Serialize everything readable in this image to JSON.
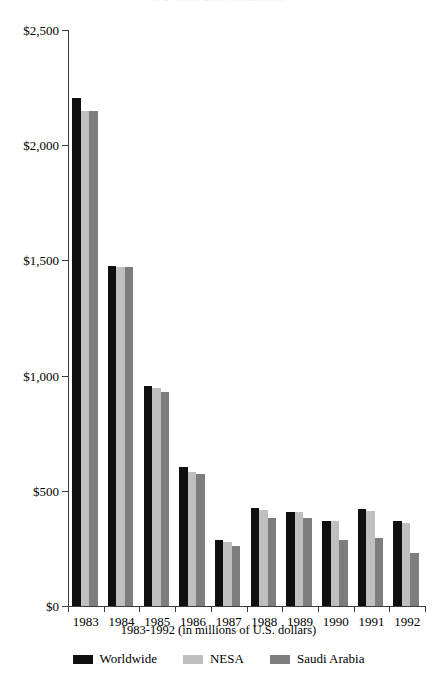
{
  "chart_data": {
    "type": "bar",
    "title": "U.S. Arms Sales Agreements",
    "subtitle": "1983-1992 (in millions of U.S. dollars)",
    "xlabel": "1983-1992 (in millions of U.S. dollars)",
    "ylabel": "",
    "categories": [
      "1983",
      "1984",
      "1985",
      "1986",
      "1987",
      "1988",
      "1989",
      "1990",
      "1991",
      "1992"
    ],
    "series": [
      {
        "name": "Worldwide",
        "color": "#0f0f0f",
        "values": [
          2205,
          1475,
          955,
          603,
          287,
          425,
          408,
          370,
          420,
          369
        ]
      },
      {
        "name": "NESA",
        "color": "#bfbfbf",
        "values": [
          2150,
          1472,
          945,
          582,
          280,
          418,
          408,
          367,
          412,
          360
        ]
      },
      {
        "name": "Saudi Arabia",
        "color": "#7d7d7d",
        "values": [
          2148,
          1470,
          930,
          573,
          262,
          382,
          382,
          287,
          295,
          230
        ]
      }
    ],
    "ylim": [
      0,
      2500
    ],
    "yticks": [
      0,
      500,
      1000,
      1500,
      2000,
      2500
    ],
    "ytick_labels": [
      "$0",
      "$500",
      "$1,000",
      "$1,500",
      "$2,000",
      "$2,500"
    ],
    "grid": false,
    "legend_position": "bottom"
  }
}
